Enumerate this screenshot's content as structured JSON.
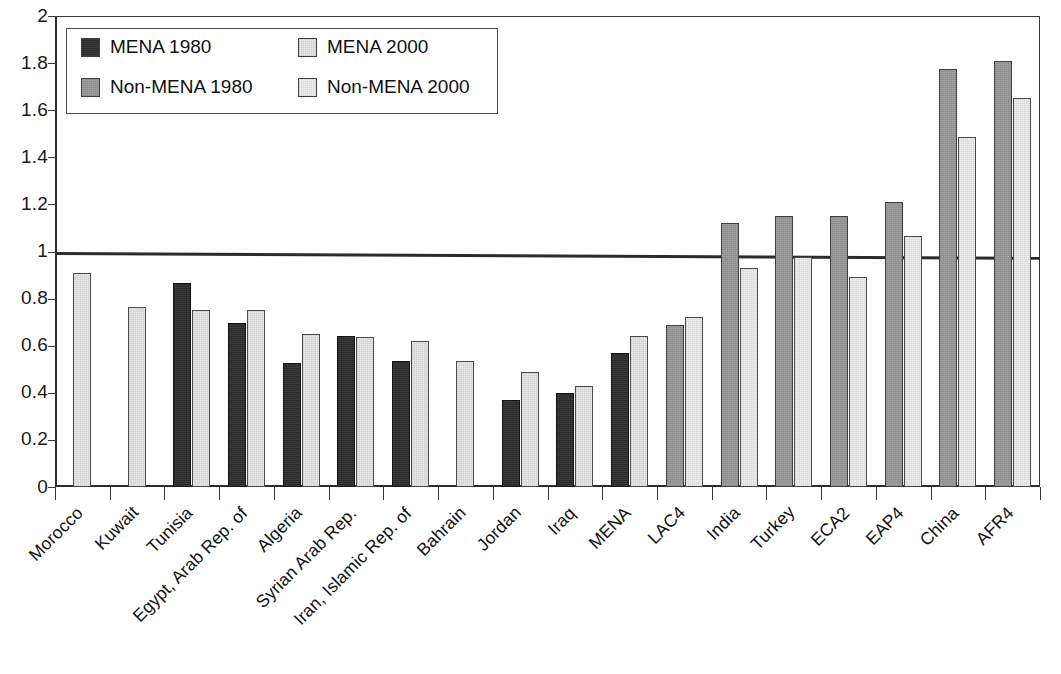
{
  "chart_data": {
    "type": "bar",
    "title": "",
    "subtitle": "",
    "xlabel": "",
    "ylabel": "",
    "ylim": [
      0,
      2
    ],
    "ytick_step": 0.2,
    "ytick_labels": [
      "2",
      "1.8",
      "1.6",
      "1.4",
      "1.2",
      "1",
      "0.8",
      "0.6",
      "0.4",
      "0.2",
      "0"
    ],
    "ytick_values": [
      2,
      1.8,
      1.6,
      1.4,
      1.2,
      1,
      0.8,
      0.6,
      0.4,
      0.2,
      0
    ],
    "grid": false,
    "legend_position": "upper-left-inside",
    "reference_line": {
      "value": 1.0,
      "label": ""
    },
    "categories": [
      "Morocco",
      "Kuwait",
      "Tunisia",
      "Egypt, Arab Rep. of",
      "Algeria",
      "Syrian Arab Rep.",
      "Iran, Islamic Rep. of",
      "Bahrain",
      "Jordan",
      "Iraq",
      "MENA",
      "LAC4",
      "India",
      "Turkey",
      "ECA2",
      "EAP4",
      "China",
      "AFR4"
    ],
    "series": [
      {
        "name": "MENA 1980",
        "color": "#2b2b2b",
        "values": [
          null,
          null,
          0.865,
          0.695,
          0.525,
          0.64,
          0.535,
          null,
          0.37,
          0.4,
          0.57,
          null,
          null,
          null,
          null,
          null,
          null,
          null
        ]
      },
      {
        "name": "MENA 2000",
        "color": "#e8e8e8",
        "values": [
          0.91,
          0.765,
          0.75,
          0.75,
          0.65,
          0.635,
          0.62,
          0.535,
          0.49,
          0.43,
          0.64,
          null,
          null,
          null,
          null,
          null,
          null,
          null
        ]
      },
      {
        "name": "Non-MENA 1980",
        "color": "#9a9a9a",
        "values": [
          null,
          null,
          null,
          null,
          null,
          null,
          null,
          null,
          null,
          null,
          null,
          0.69,
          1.12,
          1.15,
          1.15,
          1.21,
          1.775,
          1.81
        ]
      },
      {
        "name": "Non-MENA 2000",
        "color": "#eeeeee",
        "values": [
          null,
          null,
          null,
          null,
          null,
          null,
          null,
          null,
          null,
          null,
          null,
          0.72,
          0.93,
          0.975,
          0.89,
          1.065,
          1.485,
          1.65
        ]
      }
    ]
  },
  "legend": {
    "items": [
      {
        "label": "MENA 1980",
        "series_key": "s-mena1980"
      },
      {
        "label": "MENA 2000",
        "series_key": "s-mena2000"
      },
      {
        "label": "Non-MENA 1980",
        "series_key": "s-nonmena1980"
      },
      {
        "label": "Non-MENA 2000",
        "series_key": "s-nonmena2000"
      }
    ]
  },
  "footer": {
    "caption": ""
  }
}
